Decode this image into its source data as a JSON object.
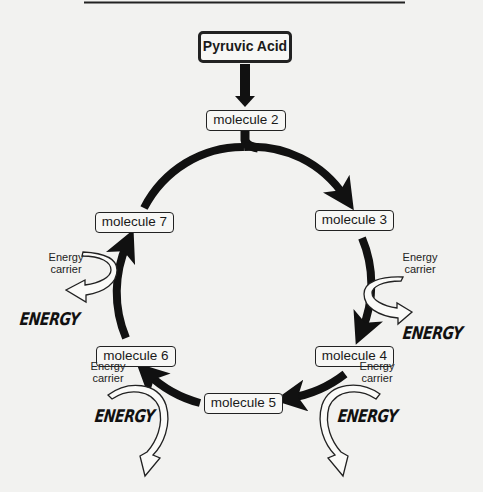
{
  "diagram": {
    "type": "cycle",
    "start": {
      "label": "Pyruvic Acid"
    },
    "molecules": [
      {
        "id": "m2",
        "label": "molecule 2"
      },
      {
        "id": "m3",
        "label": "molecule 3"
      },
      {
        "id": "m4",
        "label": "molecule 4"
      },
      {
        "id": "m5",
        "label": "molecule 5"
      },
      {
        "id": "m6",
        "label": "molecule 6"
      },
      {
        "id": "m7",
        "label": "molecule 7"
      }
    ],
    "energy_outputs": [
      {
        "between": "m3-m4",
        "carrier_label": [
          "Energy",
          "carrier"
        ],
        "energy_label": "ENERGY"
      },
      {
        "between": "m4-m5",
        "carrier_label": [
          "Energy",
          "carrier"
        ],
        "energy_label": "ENERGY"
      },
      {
        "between": "m5-m6",
        "carrier_label": [
          "Energy",
          "carrier"
        ],
        "energy_label": "ENERGY"
      },
      {
        "between": "m6-m7",
        "carrier_label": [
          "Energy",
          "carrier"
        ],
        "energy_label": "ENERGY"
      }
    ],
    "colors": {
      "background": "#f2f2f0",
      "arrow": "#111111",
      "box_border": "#222222"
    }
  }
}
